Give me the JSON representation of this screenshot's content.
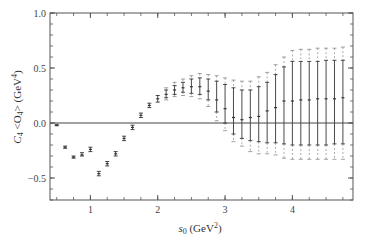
{
  "chart_data": {
    "type": "scatter",
    "title": "",
    "xlabel": "s0 (GeV^2)",
    "ylabel": "C4 <O4> (GeV^4)",
    "xlim": [
      0.4,
      4.9
    ],
    "ylim": [
      -0.7,
      1.0
    ],
    "x_ticks": [
      1,
      2,
      3,
      4
    ],
    "y_ticks": [
      -0.5,
      0.0,
      0.5,
      1.0
    ],
    "y_tick_labels": [
      "-0.5",
      "0.0",
      "0.5",
      "1.0"
    ],
    "x_tick_labels": [
      "1",
      "2",
      "3",
      "4"
    ],
    "grid": false,
    "reference_line_y": 0.0,
    "series": [
      {
        "name": "C4<O4>",
        "points": [
          {
            "x": 0.5,
            "y": -0.02,
            "inner": [
              -0.025,
              -0.015
            ],
            "outer": [
              -0.025,
              -0.015
            ]
          },
          {
            "x": 0.625,
            "y": -0.22,
            "inner": [
              -0.23,
              -0.21
            ],
            "outer": [
              -0.23,
              -0.21
            ]
          },
          {
            "x": 0.75,
            "y": -0.31,
            "inner": [
              -0.32,
              -0.3
            ],
            "outer": [
              -0.32,
              -0.3
            ]
          },
          {
            "x": 0.875,
            "y": -0.29,
            "inner": [
              -0.3,
              -0.27
            ],
            "outer": [
              -0.3,
              -0.27
            ]
          },
          {
            "x": 1.0,
            "y": -0.24,
            "inner": [
              -0.26,
              -0.22
            ],
            "outer": [
              -0.26,
              -0.22
            ]
          },
          {
            "x": 1.125,
            "y": -0.46,
            "inner": [
              -0.48,
              -0.44
            ],
            "outer": [
              -0.48,
              -0.44
            ]
          },
          {
            "x": 1.25,
            "y": -0.37,
            "inner": [
              -0.39,
              -0.35
            ],
            "outer": [
              -0.39,
              -0.35
            ]
          },
          {
            "x": 1.375,
            "y": -0.28,
            "inner": [
              -0.3,
              -0.26
            ],
            "outer": [
              -0.3,
              -0.26
            ]
          },
          {
            "x": 1.5,
            "y": -0.14,
            "inner": [
              -0.16,
              -0.12
            ],
            "outer": [
              -0.16,
              -0.12
            ]
          },
          {
            "x": 1.625,
            "y": -0.04,
            "inner": [
              -0.06,
              -0.02
            ],
            "outer": [
              -0.06,
              -0.02
            ]
          },
          {
            "x": 1.75,
            "y": 0.07,
            "inner": [
              0.05,
              0.09
            ],
            "outer": [
              0.05,
              0.09
            ]
          },
          {
            "x": 1.875,
            "y": 0.16,
            "inner": [
              0.14,
              0.18
            ],
            "outer": [
              0.14,
              0.18
            ]
          },
          {
            "x": 2.0,
            "y": 0.22,
            "inner": [
              0.19,
              0.25
            ],
            "outer": [
              0.19,
              0.25
            ]
          },
          {
            "x": 2.125,
            "y": 0.26,
            "inner": [
              0.23,
              0.3
            ],
            "outer": [
              0.21,
              0.32
            ]
          },
          {
            "x": 2.25,
            "y": 0.3,
            "inner": [
              0.26,
              0.34
            ],
            "outer": [
              0.24,
              0.37
            ]
          },
          {
            "x": 2.375,
            "y": 0.32,
            "inner": [
              0.28,
              0.37
            ],
            "outer": [
              0.25,
              0.4
            ]
          },
          {
            "x": 2.5,
            "y": 0.33,
            "inner": [
              0.27,
              0.4
            ],
            "outer": [
              0.24,
              0.43
            ]
          },
          {
            "x": 2.625,
            "y": 0.33,
            "inner": [
              0.26,
              0.41
            ],
            "outer": [
              0.22,
              0.45
            ]
          },
          {
            "x": 2.75,
            "y": 0.29,
            "inner": [
              0.21,
              0.4
            ],
            "outer": [
              0.15,
              0.44
            ]
          },
          {
            "x": 2.875,
            "y": 0.21,
            "inner": [
              0.1,
              0.38
            ],
            "outer": [
              0.02,
              0.43
            ]
          },
          {
            "x": 3.0,
            "y": 0.13,
            "inner": [
              0.0,
              0.35
            ],
            "outer": [
              -0.07,
              0.41
            ]
          },
          {
            "x": 3.125,
            "y": 0.05,
            "inner": [
              -0.1,
              0.32
            ],
            "outer": [
              -0.17,
              0.39
            ]
          },
          {
            "x": 3.25,
            "y": 0.03,
            "inner": [
              -0.14,
              0.3
            ],
            "outer": [
              -0.21,
              0.38
            ]
          },
          {
            "x": 3.375,
            "y": 0.05,
            "inner": [
              -0.16,
              0.3
            ],
            "outer": [
              -0.26,
              0.38
            ]
          },
          {
            "x": 3.5,
            "y": 0.06,
            "inner": [
              -0.17,
              0.33
            ],
            "outer": [
              -0.28,
              0.42
            ]
          },
          {
            "x": 3.625,
            "y": 0.11,
            "inner": [
              -0.18,
              0.37
            ],
            "outer": [
              -0.28,
              0.46
            ]
          },
          {
            "x": 3.75,
            "y": 0.14,
            "inner": [
              -0.18,
              0.44
            ],
            "outer": [
              -0.29,
              0.53
            ]
          },
          {
            "x": 3.875,
            "y": 0.2,
            "inner": [
              -0.19,
              0.51
            ],
            "outer": [
              -0.32,
              0.6
            ]
          },
          {
            "x": 4.0,
            "y": 0.2,
            "inner": [
              -0.2,
              0.56
            ],
            "outer": [
              -0.33,
              0.66
            ]
          },
          {
            "x": 4.125,
            "y": 0.21,
            "inner": [
              -0.2,
              0.56
            ],
            "outer": [
              -0.33,
              0.67
            ]
          },
          {
            "x": 4.25,
            "y": 0.21,
            "inner": [
              -0.2,
              0.56
            ],
            "outer": [
              -0.33,
              0.67
            ]
          },
          {
            "x": 4.375,
            "y": 0.22,
            "inner": [
              -0.2,
              0.56
            ],
            "outer": [
              -0.33,
              0.68
            ]
          },
          {
            "x": 4.5,
            "y": 0.22,
            "inner": [
              -0.2,
              0.57
            ],
            "outer": [
              -0.33,
              0.68
            ]
          },
          {
            "x": 4.625,
            "y": 0.22,
            "inner": [
              -0.19,
              0.57
            ],
            "outer": [
              -0.33,
              0.68
            ]
          },
          {
            "x": 4.75,
            "y": 0.23,
            "inner": [
              -0.19,
              0.57
            ],
            "outer": [
              -0.33,
              0.69
            ]
          }
        ]
      }
    ]
  },
  "labels": {
    "ylabel_main": "C",
    "ylabel_sub": "4",
    "ylabel_mid": " <O",
    "ylabel_sub2": "4",
    "ylabel_end": "> (GeV",
    "ylabel_sup": "4",
    "ylabel_close": ")",
    "xlabel_main": "s",
    "xlabel_sub": "0",
    "xlabel_end": " (GeV",
    "xlabel_sup": "2",
    "xlabel_close": ")"
  },
  "colors": {
    "axis": "#555555",
    "data": "#333333",
    "outer": "#888888",
    "zero_line": "#444444"
  }
}
